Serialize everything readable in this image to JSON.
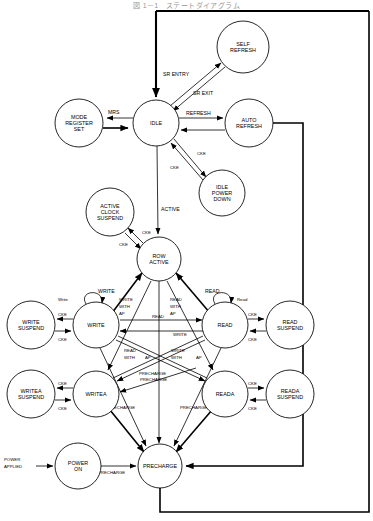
{
  "figure": {
    "title": "図 1－1　ステートダイアグラム",
    "type": "state-diagram",
    "width": 373,
    "height": 521,
    "background": "#ffffff",
    "stroke": "#000000"
  },
  "states": [
    {
      "id": "self_refresh",
      "label": "SELF\nREFRESH",
      "lines": [
        "SELF",
        "REFRESH"
      ],
      "cx": 243,
      "cy": 47,
      "r": 26
    },
    {
      "id": "mode_register",
      "label": "MODE\nREGISTER\nSET",
      "lines": [
        "MODE",
        "REGISTER",
        "SET"
      ],
      "cx": 79,
      "cy": 123,
      "r": 24
    },
    {
      "id": "idle",
      "label": "IDLE",
      "lines": [
        "IDLE"
      ],
      "cx": 156,
      "cy": 123,
      "r": 23
    },
    {
      "id": "auto_refresh",
      "label": "AUTO\nREFRESH",
      "lines": [
        "AUTO",
        "REFRESH"
      ],
      "cx": 249,
      "cy": 123,
      "r": 24
    },
    {
      "id": "idle_power_down",
      "label": "IDLE\nPOWER\nDOWN",
      "lines": [
        "IDLE",
        "POWER",
        "DOWN"
      ],
      "cx": 222,
      "cy": 193,
      "r": 23
    },
    {
      "id": "active_clock_suspend",
      "label": "ACTIVE\nCLOCK\nSUSPEND",
      "lines": [
        "ACTIVE",
        "CLOCK",
        "SUSPEND"
      ],
      "cx": 110,
      "cy": 212,
      "r": 24
    },
    {
      "id": "row_active",
      "label": "ROW\nACTIVE",
      "lines": [
        "ROW",
        "ACTIVE"
      ],
      "cx": 159,
      "cy": 259,
      "r": 22
    },
    {
      "id": "write_suspend",
      "label": "WRITE\nSUSPEND",
      "lines": [
        "WRITE",
        "SUSPEND"
      ],
      "cx": 31,
      "cy": 325,
      "r": 24
    },
    {
      "id": "write",
      "label": "WRITE",
      "lines": [
        "WRITE"
      ],
      "cx": 96,
      "cy": 325,
      "r": 23
    },
    {
      "id": "read",
      "label": "READ",
      "lines": [
        "READ"
      ],
      "cx": 225,
      "cy": 325,
      "r": 23
    },
    {
      "id": "read_suspend",
      "label": "READ\nSUSPEND",
      "lines": [
        "READ",
        "SUSPEND"
      ],
      "cx": 290,
      "cy": 325,
      "r": 24
    },
    {
      "id": "writea_suspend",
      "label": "WRITEA\nSUSPEND",
      "lines": [
        "WRITEA",
        "SUSPEND"
      ],
      "cx": 31,
      "cy": 394,
      "r": 24
    },
    {
      "id": "writea",
      "label": "WRITEA",
      "lines": [
        "WRITEA"
      ],
      "cx": 96,
      "cy": 394,
      "r": 23
    },
    {
      "id": "reada",
      "label": "READA",
      "lines": [
        "READA"
      ],
      "cx": 225,
      "cy": 394,
      "r": 23
    },
    {
      "id": "reada_suspend",
      "label": "READA\nSUSPEND",
      "lines": [
        "READA",
        "SUSPEND"
      ],
      "cx": 290,
      "cy": 394,
      "r": 24
    },
    {
      "id": "power_on",
      "label": "POWER\nON",
      "lines": [
        "POWER",
        "ON"
      ],
      "cx": 78,
      "cy": 466,
      "r": 23
    },
    {
      "id": "precharge",
      "label": "PRECHARGE",
      "lines": [
        "PRECHARGE"
      ],
      "cx": 160,
      "cy": 466,
      "r": 22
    }
  ],
  "external_labels": [
    {
      "id": "power_applied",
      "lines": [
        "POWER",
        "APPLIED"
      ],
      "x": 24,
      "y": 460
    }
  ],
  "transitions": [
    {
      "id": "sr_entry",
      "from": "idle",
      "to": "self_refresh",
      "label": "SR ENTRY"
    },
    {
      "id": "sr_exit",
      "from": "self_refresh",
      "to": "idle",
      "label": "SR EXIT"
    },
    {
      "id": "self_ref_loop",
      "from": "self_refresh",
      "to": "idle",
      "label": ""
    },
    {
      "id": "mrs",
      "from": "idle",
      "to": "mode_register",
      "label": "MRS"
    },
    {
      "id": "mrs_back",
      "from": "mode_register",
      "to": "idle",
      "label": ""
    },
    {
      "id": "refresh",
      "from": "idle",
      "to": "auto_refresh",
      "label": "REFRESH"
    },
    {
      "id": "auto_ref_back",
      "from": "auto_refresh",
      "to": "idle",
      "label": ""
    },
    {
      "id": "cke_down",
      "from": "idle",
      "to": "idle_power_down",
      "label": "CKE"
    },
    {
      "id": "cke_up",
      "from": "idle_power_down",
      "to": "idle",
      "label": "CKE"
    },
    {
      "id": "active",
      "from": "idle",
      "to": "row_active",
      "label": "ACTIVE"
    },
    {
      "id": "acs_cke_in",
      "from": "row_active",
      "to": "active_clock_suspend",
      "label": "CKE"
    },
    {
      "id": "acs_cke_out",
      "from": "active_clock_suspend",
      "to": "row_active",
      "label": "CKE"
    },
    {
      "id": "write",
      "from": "row_active",
      "to": "write",
      "label": "WRITE"
    },
    {
      "id": "read",
      "from": "row_active",
      "to": "read",
      "label": "READ"
    },
    {
      "id": "write_with_ap",
      "from": "row_active",
      "to": "writea",
      "label": "WRITE\nWITH\nAP"
    },
    {
      "id": "read_with_ap",
      "from": "row_active",
      "to": "reada",
      "label": "READ\nWITH\nAP"
    },
    {
      "id": "write_loop",
      "from": "write",
      "to": "write",
      "label": "Write"
    },
    {
      "id": "read_loop",
      "from": "read",
      "to": "read",
      "label": "Read"
    },
    {
      "id": "ws_cke_in",
      "from": "write",
      "to": "write_suspend",
      "label": "CKE"
    },
    {
      "id": "ws_cke_out",
      "from": "write_suspend",
      "to": "write",
      "label": "CKE"
    },
    {
      "id": "rs_cke_in",
      "from": "read",
      "to": "read_suspend",
      "label": "CKE"
    },
    {
      "id": "rs_cke_out",
      "from": "read_suspend",
      "to": "read",
      "label": "CKE"
    },
    {
      "id": "was_cke_in",
      "from": "writea",
      "to": "writea_suspend",
      "label": "CKE"
    },
    {
      "id": "was_cke_out",
      "from": "writea_suspend",
      "to": "writea",
      "label": "CKE"
    },
    {
      "id": "ras_cke_in",
      "from": "reada",
      "to": "reada_suspend",
      "label": "CKE"
    },
    {
      "id": "ras_cke_out",
      "from": "reada_suspend",
      "to": "reada",
      "label": "CKE"
    },
    {
      "id": "w2r_read",
      "from": "write",
      "to": "read",
      "label": "READ"
    },
    {
      "id": "r2w_write",
      "from": "read",
      "to": "write",
      "label": "WRITE"
    },
    {
      "id": "w2ra",
      "from": "write",
      "to": "reada",
      "label": "READ WITH AP"
    },
    {
      "id": "r2wa",
      "from": "read",
      "to": "writea",
      "label": "WRITE WITH AP"
    },
    {
      "id": "wa2r",
      "from": "writea",
      "to": "read",
      "label": "READ"
    },
    {
      "id": "ra2w",
      "from": "reada",
      "to": "write",
      "label": "WRITE"
    },
    {
      "id": "w_pre",
      "from": "write",
      "to": "precharge",
      "label": "PRECHARGE"
    },
    {
      "id": "r_pre",
      "from": "read",
      "to": "precharge",
      "label": "PRECHARGE"
    },
    {
      "id": "wa_pre",
      "from": "writea",
      "to": "precharge",
      "label": "PRECHARGE"
    },
    {
      "id": "ra_pre",
      "from": "reada",
      "to": "precharge",
      "label": "PRECHARGE"
    },
    {
      "id": "row_pre",
      "from": "row_active",
      "to": "precharge",
      "label": "PRECHARGE"
    },
    {
      "id": "pwr_applied",
      "from": "power_applied",
      "to": "power_on",
      "label": "POWER APPLIED"
    },
    {
      "id": "pwr_pre",
      "from": "power_on",
      "to": "precharge",
      "label": "PRECHARGE"
    },
    {
      "id": "pre_idle",
      "from": "precharge",
      "to": "idle",
      "label": ""
    },
    {
      "id": "auto_ret",
      "from": "auto_refresh",
      "to": "precharge",
      "label": ""
    }
  ],
  "edge_labels": {
    "sr_entry": "SR ENTRY",
    "sr_exit": "SR EXIT",
    "mrs": "MRS",
    "refresh": "REFRESH",
    "cke": "CKE",
    "cke_alt": "CKE",
    "active": "ACTIVE",
    "write": "WRITE",
    "read": "READ",
    "write_sm": "Write",
    "read_sm": "Read",
    "write_with_ap_1": "WRITE",
    "write_with_ap_2": "WITH",
    "write_with_ap_3": "AP",
    "read_with_ap_1": "READ",
    "read_with_ap_2": "WITH",
    "read_with_ap_3": "AP",
    "read_with_ap_inline": "READ WITH AP",
    "write_with_ap_inline": "WRITE WITH AP",
    "precharge": "PRECHARGE",
    "power_applied_1": "POWER",
    "power_applied_2": "APPLIED"
  }
}
